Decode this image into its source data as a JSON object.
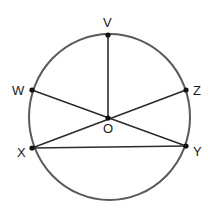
{
  "diagram": {
    "type": "circle-geometry",
    "circle": {
      "cx": 109.5,
      "cy": 117,
      "rx": 80.5,
      "ry": 83,
      "stroke": "#5a5a5a"
    },
    "points": [
      {
        "id": "V",
        "label": "V",
        "x": 108,
        "y": 35,
        "lx": 103,
        "ly": 27
      },
      {
        "id": "W",
        "label": "W",
        "x": 32,
        "y": 90,
        "lx": 12,
        "ly": 95
      },
      {
        "id": "Z",
        "label": "Z",
        "x": 186,
        "y": 90,
        "lx": 193,
        "ly": 95
      },
      {
        "id": "O",
        "label": "O",
        "x": 108,
        "y": 118,
        "lx": 103,
        "ly": 133
      },
      {
        "id": "X",
        "label": "X",
        "x": 32,
        "y": 148,
        "lx": 17,
        "ly": 157
      },
      {
        "id": "Y",
        "label": "Y",
        "x": 186,
        "y": 146,
        "lx": 193,
        "ly": 156
      }
    ],
    "segments": [
      {
        "from": "V",
        "to": "O"
      },
      {
        "from": "W",
        "to": "Y"
      },
      {
        "from": "X",
        "to": "Z"
      },
      {
        "from": "X",
        "to": "Y"
      }
    ],
    "line_color": "#2b2b2b",
    "point_color": "#111111"
  }
}
